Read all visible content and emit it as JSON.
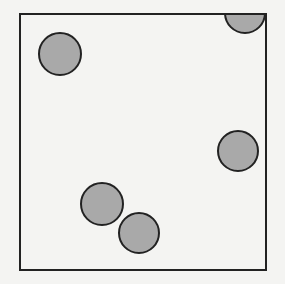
{
  "diagram": {
    "type": "particles-in-box",
    "background": "#f4f4f2",
    "box": {
      "x": 20,
      "y": 14,
      "width": 246,
      "height": 256,
      "stroke": "#222222",
      "stroke_width": 2
    },
    "circle_style": {
      "fill": "#a9a9a9",
      "stroke": "#222222",
      "stroke_width": 2
    },
    "circles": [
      {
        "cx": 60,
        "cy": 54,
        "r": 21
      },
      {
        "cx": 245,
        "cy": 13,
        "r": 20
      },
      {
        "cx": 238,
        "cy": 151,
        "r": 20
      },
      {
        "cx": 102,
        "cy": 204,
        "r": 21
      },
      {
        "cx": 139,
        "cy": 233,
        "r": 20
      }
    ]
  }
}
